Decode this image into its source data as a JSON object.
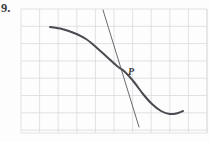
{
  "figure": {
    "problem_number": "9.",
    "point_label": "P",
    "background_color": "#fdfdfd",
    "grid": {
      "line_color": "#d9dade",
      "line_width": 0.8,
      "left": 21,
      "top": 9,
      "right": 207,
      "bottom": 133,
      "cell_width": 18.6,
      "cell_height": 17.3,
      "columns": 10,
      "rows": 7
    },
    "curve": {
      "name": "sigmoid-decreasing-curve",
      "color": "#4a4a50",
      "stroke_width": 2.0,
      "description": "Smooth decreasing S-shaped curve with an inflection point at P and a local minimum near the right",
      "points": [
        [
          50,
          27
        ],
        [
          62,
          29
        ],
        [
          74,
          33
        ],
        [
          86,
          39
        ],
        [
          97,
          48
        ],
        [
          107,
          57
        ],
        [
          117,
          66
        ],
        [
          125,
          72
        ],
        [
          134,
          82
        ],
        [
          143,
          94
        ],
        [
          152,
          104
        ],
        [
          161,
          111
        ],
        [
          170,
          114
        ],
        [
          178,
          113
        ],
        [
          183,
          111
        ]
      ]
    },
    "tangent": {
      "name": "tangent-line-at-P",
      "color": "#5a5a60",
      "stroke_width": 0.9,
      "x1": 103,
      "y1": 10,
      "x2": 139,
      "y2": 127
    },
    "tangency_point": {
      "x": 125,
      "y": 72
    },
    "label_position": {
      "x": 128,
      "y": 66
    }
  },
  "chart_data": {
    "type": "line",
    "title": "",
    "xlabel": "",
    "ylabel": "",
    "grid": true,
    "legend": null,
    "annotations": [
      {
        "text": "P",
        "x": 125,
        "y": 72,
        "note": "point of tangency / inflection point on the curve"
      },
      {
        "text": "9.",
        "x": 2,
        "y": 5,
        "note": "problem number label outside the grid"
      }
    ],
    "series": [
      {
        "name": "curve",
        "kind": "smooth-decreasing-s-curve",
        "x": [
          50,
          62,
          74,
          86,
          97,
          107,
          117,
          125,
          134,
          143,
          152,
          161,
          170,
          178,
          183
        ],
        "y": [
          27,
          29,
          33,
          39,
          48,
          57,
          66,
          72,
          82,
          94,
          104,
          111,
          114,
          113,
          111
        ]
      },
      {
        "name": "tangent line at P",
        "kind": "straight-line",
        "x": [
          103,
          139
        ],
        "y": [
          10,
          127
        ]
      }
    ]
  }
}
